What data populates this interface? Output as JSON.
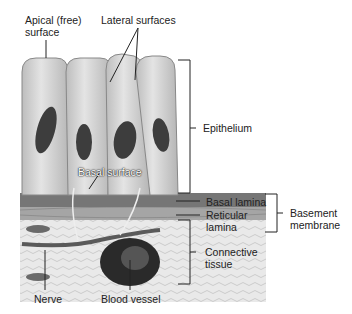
{
  "diagram": {
    "labels": {
      "apical_line1": "Apical (free)",
      "apical_line2": "surface",
      "lateral": "Lateral surfaces",
      "basal_surface": "Basal surface",
      "epithelium": "Epithelium",
      "basal_lamina": "Basal lamina",
      "reticular_line1": "Reticular",
      "reticular_line2": "lamina",
      "basement_line1": "Basement",
      "basement_line2": "membrane",
      "connective_line1": "Connective",
      "connective_line2": "tissue",
      "nerve": "Nerve",
      "blood_vessel": "Blood vessel"
    },
    "colors": {
      "cell_fill": "#d9d9d9",
      "cell_edge": "#8a8a8a",
      "nucleus": "#3a3a3a",
      "basal_lamina": "#6e6e6e",
      "reticular": "#9a9a9a",
      "connective": "#e6e6e6",
      "line": "#222222"
    }
  }
}
